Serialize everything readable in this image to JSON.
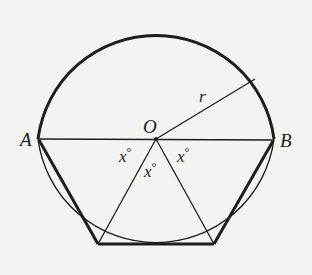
{
  "diagram": {
    "type": "geometry",
    "colors": {
      "background": "#f3f3f1",
      "ink": "#1e1e1e"
    },
    "circle": {
      "cx": 156,
      "cy": 139,
      "r": 119
    },
    "points": {
      "A": {
        "label": "A",
        "x": 38,
        "y": 139
      },
      "B": {
        "label": "B",
        "x": 274,
        "y": 140
      },
      "O": {
        "label": "O",
        "x": 156,
        "y": 139
      },
      "P1": {
        "label": "",
        "x": 98,
        "y": 244
      },
      "P2": {
        "label": "",
        "x": 214,
        "y": 244
      },
      "R": {
        "label": "",
        "x": 255,
        "y": 79
      }
    },
    "labels": {
      "A": "A",
      "B": "B",
      "O": "O",
      "r": "r",
      "angle_left": "x",
      "angle_middle": "x",
      "angle_right": "x",
      "degree": "°"
    },
    "thick_segments": [
      "upper-arc A→B",
      "A-P1",
      "P1-P2",
      "P2-B"
    ],
    "thin_segments": [
      "lower-arc A→B",
      "A-B (diameter)",
      "O-P1",
      "O-P2",
      "O-R (radius r)"
    ]
  }
}
